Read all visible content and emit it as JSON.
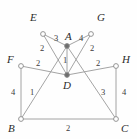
{
  "figure": {
    "type": "weighted-undirected-graph",
    "background_color": "#fefefe",
    "line_color": "#9a9a9a",
    "node_fill": "#ffffff",
    "node_stroke": "#8a8a8a",
    "label_color": "#2b2b2b",
    "weight_color": "#3a3a3a",
    "nodes": [
      {
        "id": "E",
        "label": "E",
        "x": 43,
        "y": 34,
        "label_x": 30,
        "label_y": 12,
        "filled": false
      },
      {
        "id": "G",
        "label": "G",
        "x": 91,
        "y": 34,
        "label_x": 97,
        "label_y": 12,
        "filled": false
      },
      {
        "id": "A",
        "label": "A",
        "x": 67,
        "y": 46,
        "label_x": 65,
        "label_y": 31,
        "filled": true
      },
      {
        "id": "F",
        "label": "F",
        "x": 21,
        "y": 66,
        "label_x": 7,
        "label_y": 54,
        "filled": false
      },
      {
        "id": "H",
        "label": "H",
        "x": 116,
        "y": 66,
        "label_x": 122,
        "label_y": 54,
        "filled": false
      },
      {
        "id": "D",
        "label": "D",
        "x": 67,
        "y": 75,
        "label_x": 63,
        "label_y": 80,
        "filled": true
      },
      {
        "id": "B",
        "label": "B",
        "x": 21,
        "y": 119,
        "label_x": 8,
        "label_y": 123,
        "filled": false
      },
      {
        "id": "C",
        "label": "C",
        "x": 116,
        "y": 119,
        "label_x": 121,
        "label_y": 123,
        "filled": false
      }
    ],
    "edges": [
      {
        "from": "E",
        "to": "A",
        "weight": "3",
        "wx": 54,
        "wy": 34
      },
      {
        "from": "A",
        "to": "G",
        "weight": "4",
        "wx": 79,
        "wy": 34
      },
      {
        "from": "E",
        "to": "D",
        "weight": "2",
        "wx": 40,
        "wy": 44
      },
      {
        "from": "G",
        "to": "D",
        "weight": "2",
        "wx": 90,
        "wy": 44
      },
      {
        "from": "A",
        "to": "D",
        "weight": "1",
        "wx": 63,
        "wy": 56
      },
      {
        "from": "F",
        "to": "D",
        "weight": "2",
        "wx": 36,
        "wy": 59
      },
      {
        "from": "D",
        "to": "H",
        "weight": "2",
        "wx": 96,
        "wy": 59
      },
      {
        "from": "F",
        "to": "B",
        "weight": "4",
        "wx": 11,
        "wy": 88
      },
      {
        "from": "B",
        "to": "A",
        "weight": "1",
        "wx": 30,
        "wy": 88
      },
      {
        "from": "A",
        "to": "C",
        "weight": "3",
        "wx": 101,
        "wy": 88
      },
      {
        "from": "H",
        "to": "C",
        "weight": "4",
        "wx": 122,
        "wy": 88
      },
      {
        "from": "B",
        "to": "C",
        "weight": "2",
        "wx": 66,
        "wy": 124
      }
    ]
  }
}
